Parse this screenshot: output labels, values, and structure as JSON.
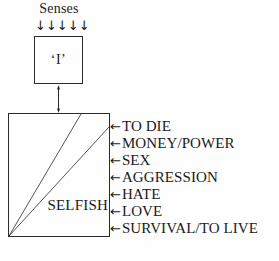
{
  "diagram": {
    "senses": {
      "label": "Senses",
      "arrow_glyph": "↓",
      "arrow_count": 5
    },
    "self_box": {
      "label": "‘I’"
    },
    "connector": {
      "type": "double-headed-vertical-arrow"
    },
    "main_box": {
      "caption": "SELFISH",
      "diagonals": 2
    },
    "drive_arrow_glyph": "←",
    "drives": [
      {
        "label": "TO DIE"
      },
      {
        "label": "MONEY/POWER"
      },
      {
        "label": "SEX"
      },
      {
        "label": "AGGRESSION"
      },
      {
        "label": "HATE"
      },
      {
        "label": "LOVE"
      },
      {
        "label": "SURVIVAL/TO LIVE"
      }
    ],
    "colors": {
      "ink": "#1a1a1a",
      "stroke": "#2b2b2b",
      "background": "#fefefe"
    }
  }
}
